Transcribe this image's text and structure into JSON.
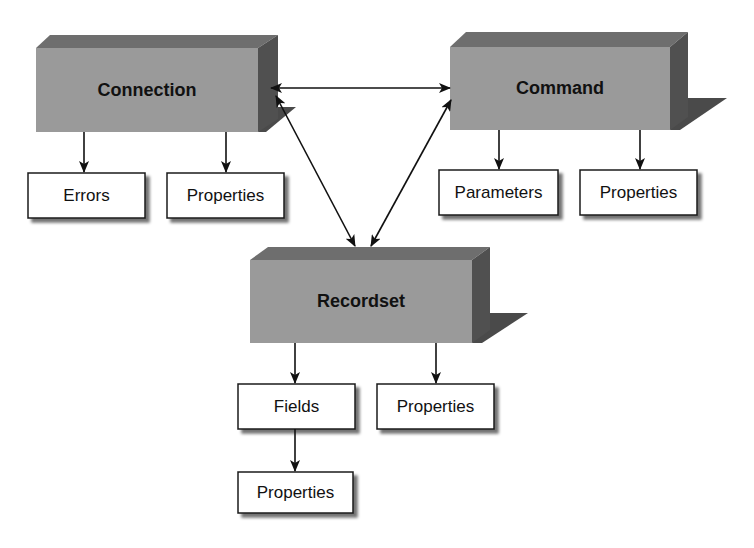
{
  "diagram": {
    "type": "object-model",
    "colors": {
      "box_front": "#9a9a9a",
      "box_top": "#6e6e6e",
      "box_side": "#505050",
      "shadow": "#4a4a4a",
      "collection_fill": "#ffffff",
      "collection_border": "#1a1a1a",
      "arrow": "#111111"
    },
    "objects": [
      {
        "id": "connection",
        "label": "Connection"
      },
      {
        "id": "command",
        "label": "Command"
      },
      {
        "id": "recordset",
        "label": "Recordset"
      }
    ],
    "collections": [
      {
        "id": "connection-errors",
        "label": "Errors",
        "parent": "Connection"
      },
      {
        "id": "connection-properties",
        "label": "Properties",
        "parent": "Connection"
      },
      {
        "id": "command-parameters",
        "label": "Parameters",
        "parent": "Command"
      },
      {
        "id": "command-properties",
        "label": "Properties",
        "parent": "Command"
      },
      {
        "id": "recordset-fields",
        "label": "Fields",
        "parent": "Recordset"
      },
      {
        "id": "recordset-properties",
        "label": "Properties",
        "parent": "Recordset"
      },
      {
        "id": "fields-properties",
        "label": "Properties",
        "parent": "Fields"
      }
    ],
    "relationships": [
      {
        "from": "Connection",
        "to": "Command",
        "direction": "bidirectional"
      },
      {
        "from": "Connection",
        "to": "Recordset",
        "direction": "bidirectional"
      },
      {
        "from": "Command",
        "to": "Recordset",
        "direction": "bidirectional"
      },
      {
        "from": "Connection",
        "to": "Errors",
        "direction": "one-way"
      },
      {
        "from": "Connection",
        "to": "Properties",
        "direction": "one-way"
      },
      {
        "from": "Command",
        "to": "Parameters",
        "direction": "one-way"
      },
      {
        "from": "Command",
        "to": "Properties",
        "direction": "one-way"
      },
      {
        "from": "Recordset",
        "to": "Fields",
        "direction": "one-way"
      },
      {
        "from": "Recordset",
        "to": "Properties",
        "direction": "one-way"
      },
      {
        "from": "Fields",
        "to": "Properties",
        "direction": "one-way"
      }
    ]
  }
}
